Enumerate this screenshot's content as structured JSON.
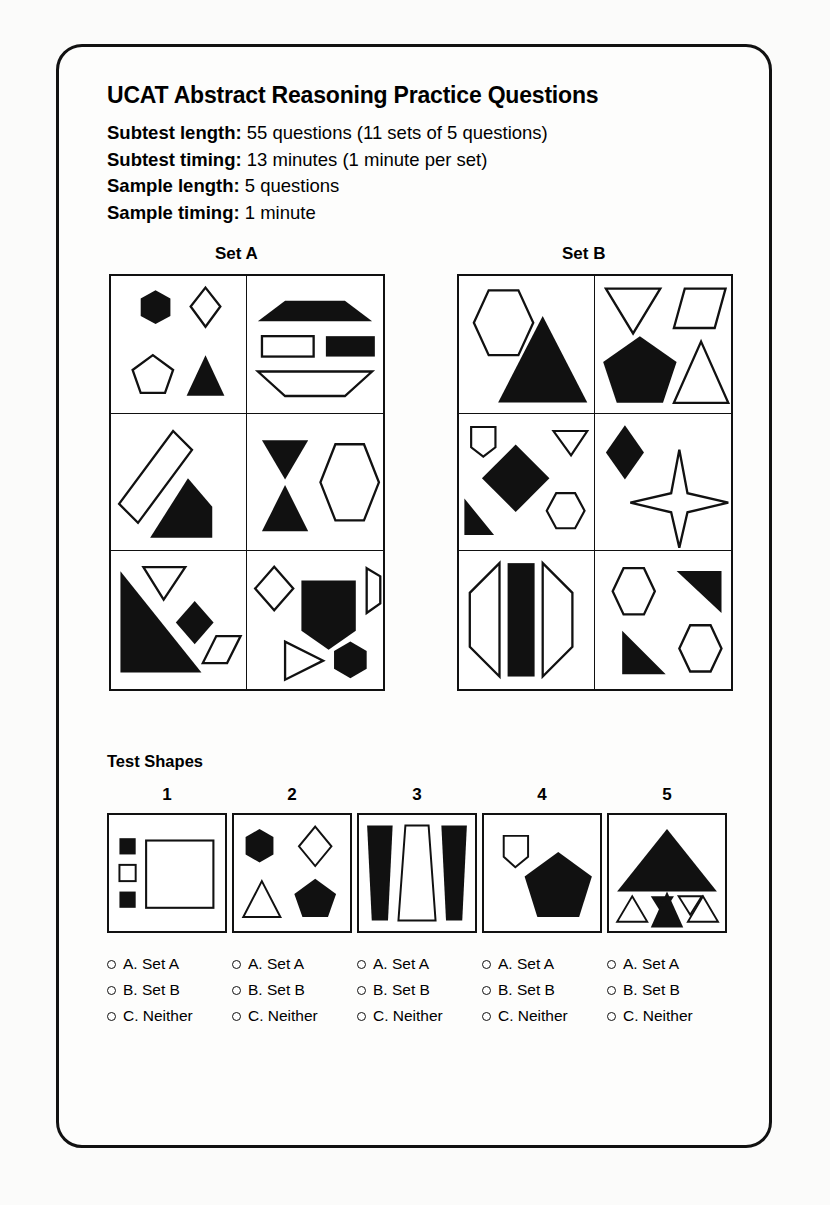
{
  "document": {
    "title": "UCAT Abstract Reasoning Practice Questions",
    "meta": [
      {
        "label": "Subtest length:",
        "value": "55 questions (11 sets of 5 questions)"
      },
      {
        "label": "Subtest timing:",
        "value": "13 minutes (1 minute per set)"
      },
      {
        "label": "Sample length:",
        "value": "5 questions"
      },
      {
        "label": "Sample timing:",
        "value": "1 minute"
      }
    ]
  },
  "sets": {
    "set_a_label": "Set A",
    "set_b_label": "Set B",
    "set_a_cells": [
      "filled-hexagon, outlined-diamond, outlined-pentagon, filled-triangle",
      "filled-wide-trapezoid, outlined-rectangle, filled-rectangle, outlined-inverted-trapezoid",
      "outlined-rotated-rectangle, filled-quadrilateral",
      "filled-inverted-triangle, filled-triangle, outlined-hexagon",
      "filled-right-triangle, outlined-inverted-triangle, filled-diamond, outlined-parallelogram",
      "outlined-diamond, filled-pentagon-block, outlined-trapezoid, outlined-right-triangle, filled-hexagon"
    ],
    "set_b_cells": [
      "outlined-hexagon, filled-triangle",
      "outlined-inverted-triangle, outlined-parallelogram, filled-pentagon, outlined-triangle",
      "outlined-small-pentagon, filled-square-rotated, outlined-small-inverted-triangle, filled-right-triangle, outlined-small-hexagon",
      "filled-diamond, outlined-four-point-star",
      "outlined-left-trapezoid, filled-rectangle, outlined-right-trapezoid",
      "outlined-hexagon, filled-right-triangle, filled-right-triangle, outlined-hexagon"
    ]
  },
  "test_shapes": {
    "heading": "Test Shapes",
    "items": [
      {
        "number": "1",
        "contents": "filled-small-square, outlined-small-square, filled-small-square, outlined-large-square"
      },
      {
        "number": "2",
        "contents": "filled-hexagon, outlined-diamond, outlined-triangle, filled-pentagon"
      },
      {
        "number": "3",
        "contents": "filled-tapered-bar, outlined-tapered-bar, filled-tapered-bar"
      },
      {
        "number": "4",
        "contents": "outlined-small-shield-pentagon, filled-large-pentagon"
      },
      {
        "number": "5",
        "contents": "filled-large-triangle, outlined-small-triangle, filled-small-inverted-triangle, outlined-small-inverted-triangle, filled-small-triangle, outlined-small-triangle"
      }
    ]
  },
  "answers": {
    "options": [
      {
        "key": "A",
        "label": "A. Set A"
      },
      {
        "key": "B",
        "label": "B. Set B"
      },
      {
        "key": "C",
        "label": "C. Neither"
      }
    ],
    "columns": [
      {
        "question": "1"
      },
      {
        "question": "2"
      },
      {
        "question": "3"
      },
      {
        "question": "4"
      },
      {
        "question": "5"
      }
    ]
  },
  "colors": {
    "ink": "#111111",
    "fill": "#111111",
    "paper": "#ffffff",
    "page_background": "#fbfbfa"
  }
}
